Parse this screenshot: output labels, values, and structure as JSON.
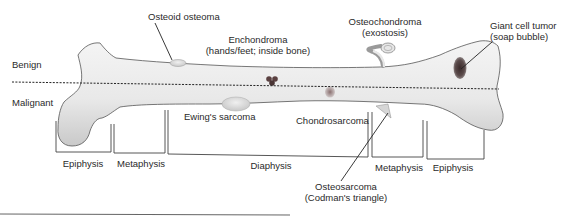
{
  "diagram": {
    "zones": {
      "benign_label": "Benign",
      "malignant_label": "Malignant"
    },
    "regions": [
      {
        "label": "Epiphysis"
      },
      {
        "label": "Metaphysis"
      },
      {
        "label": "Diaphysis"
      },
      {
        "label": "Metaphysis"
      },
      {
        "label": "Epiphysis"
      }
    ],
    "benign_tumors": [
      {
        "name": "Osteoid osteoma",
        "detail": ""
      },
      {
        "name": "Enchondroma",
        "detail": "(hands/feet; inside bone)"
      },
      {
        "name": "Osteochondroma",
        "detail": "(exostosis)"
      },
      {
        "name": "Giant cell tumor",
        "detail": "(soap bubble)"
      }
    ],
    "malignant_tumors": [
      {
        "name": "Ewing's sarcoma",
        "detail": ""
      },
      {
        "name": "Chondrosarcoma",
        "detail": ""
      },
      {
        "name": "Osteosarcoma",
        "detail": "(Codman's triangle)"
      }
    ],
    "colors": {
      "bone_light": "#f2f2f2",
      "bone_shadow": "#bdbdbd",
      "lesion_dark": "#4a4a4a",
      "lesion_red": "#6b4444",
      "text": "#2a2a2a"
    }
  }
}
